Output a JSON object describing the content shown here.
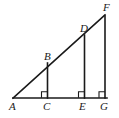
{
  "figure": {
    "kind": "geometry-diagram",
    "background_color": "#ffffff",
    "stroke_color": "#1a1a1a",
    "label_color": "#1a1a1a",
    "stroke_width": 1.6,
    "label_font_style": "italic-serif",
    "label_font_size_px": 11
  },
  "points": [
    {
      "id": "A",
      "label": "A",
      "x": 13,
      "y": 98,
      "label_x": 9,
      "label_y": 101
    },
    {
      "id": "B",
      "label": "B",
      "x": 47.5,
      "y": 63,
      "label_x": 44,
      "label_y": 51
    },
    {
      "id": "C",
      "label": "C",
      "x": 47.5,
      "y": 98,
      "label_x": 43,
      "label_y": 101
    },
    {
      "id": "D",
      "label": "D",
      "x": 84.5,
      "y": 35,
      "label_x": 80,
      "label_y": 23
    },
    {
      "id": "E",
      "label": "E",
      "x": 84.5,
      "y": 98,
      "label_x": 79,
      "label_y": 101
    },
    {
      "id": "F",
      "label": "F",
      "x": 105,
      "y": 16,
      "label_x": 103,
      "label_y": 2
    },
    {
      "id": "G",
      "label": "G",
      "x": 105,
      "y": 98,
      "label_x": 100,
      "label_y": 101
    }
  ],
  "segments": [
    {
      "id": "AG",
      "name": "base-line",
      "x1": 13,
      "y1": 98,
      "x2": 107,
      "y2": 98
    },
    {
      "id": "AF",
      "name": "hypotenuse-line",
      "x1": 13,
      "y1": 98,
      "x2": 105,
      "y2": 15
    },
    {
      "id": "BC",
      "name": "segment-bc",
      "x1": 47.5,
      "y1": 63,
      "x2": 47.5,
      "y2": 98
    },
    {
      "id": "DE",
      "name": "segment-de",
      "x1": 84.5,
      "y1": 35,
      "x2": 84.5,
      "y2": 98
    },
    {
      "id": "FG",
      "name": "segment-fg",
      "x1": 105,
      "y1": 16,
      "x2": 105,
      "y2": 98
    }
  ],
  "right_angle_marks": [
    {
      "id": "angle-at-C",
      "at": "C",
      "x": 41.5,
      "y": 91.8,
      "size": 6
    },
    {
      "id": "angle-at-E",
      "at": "E",
      "x": 78.5,
      "y": 91.8,
      "size": 6
    },
    {
      "id": "angle-at-G",
      "at": "G",
      "x": 99,
      "y": 91.8,
      "size": 6
    }
  ]
}
